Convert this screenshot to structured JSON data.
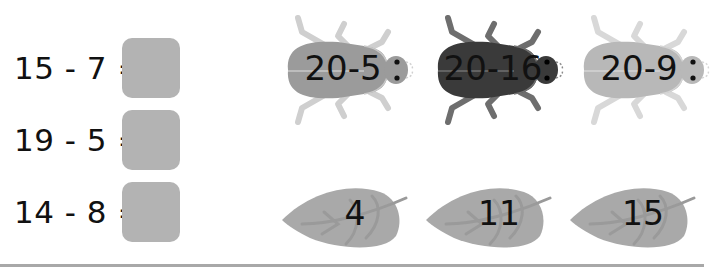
{
  "equations": [
    {
      "text": "15 - 7 =",
      "answer": ""
    },
    {
      "text": "19 - 5 =",
      "answer": ""
    },
    {
      "text": "14 - 8 ="
    }
  ],
  "beetles": [
    {
      "label": "20-5",
      "color": "#9b9b9b",
      "leg_color": "#cfcfcf"
    },
    {
      "label": "20-16",
      "color": "#3a3a3a",
      "leg_color": "#6e6e6e"
    },
    {
      "label": "20-9",
      "color": "#b8b8b8",
      "leg_color": "#d8d8d8"
    }
  ],
  "leaves": [
    {
      "label": "4"
    },
    {
      "label": "11"
    },
    {
      "label": "15"
    }
  ],
  "colors": {
    "answer_box": "#b3b3b3",
    "leaf": "#a9a9a9",
    "leaf_vein": "#9a9a9a",
    "divider": "#a8a8a8"
  }
}
